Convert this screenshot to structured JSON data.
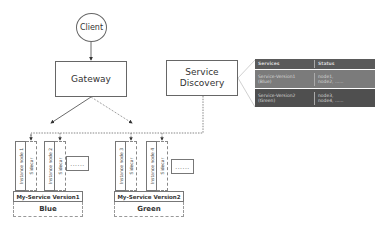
{
  "nodes": {
    "client": "Client",
    "gateway": "Gateway",
    "service_discovery_line1": "Service",
    "service_discovery_line2": "Discovery"
  },
  "registry_table": {
    "headers": [
      "Services",
      "Status"
    ],
    "rows": [
      {
        "service_line1": "Service-Version1",
        "service_line2": "(Blue)",
        "status_line1": "node1,",
        "status_line2": "node2, ......"
      },
      {
        "service_line1": "Service-Version2",
        "service_line2": "(Green)",
        "status_line1": "node3,",
        "status_line2": "node4, ......"
      }
    ],
    "colors": {
      "header": "#5a5a5a",
      "row1": "#7b7b7b",
      "row2": "#4f4f4f"
    }
  },
  "groups": [
    {
      "instances": [
        {
          "instance": "Instance node 1",
          "sidecar": "Sidecar"
        },
        {
          "instance": "Instance node 2",
          "sidecar": "Sidecar"
        }
      ],
      "more": "......",
      "version": "My-Service Version1",
      "color": "Blue"
    },
    {
      "instances": [
        {
          "instance": "Instance node 3",
          "sidecar": "Sidecar"
        },
        {
          "instance": "Instance node 4",
          "sidecar": "Sidecar"
        }
      ],
      "more": "......",
      "version": "My-Service Version2",
      "color": "Green"
    }
  ],
  "edges": [
    {
      "from": "Client",
      "to": "Gateway",
      "style": "solid"
    },
    {
      "from": "Gateway",
      "to": "My-Service Version1",
      "style": "solid"
    },
    {
      "from": "Gateway",
      "to": "My-Service Version2",
      "style": "dashed"
    },
    {
      "from": "Service Discovery",
      "to": "Sidecars",
      "style": "dashed"
    }
  ]
}
